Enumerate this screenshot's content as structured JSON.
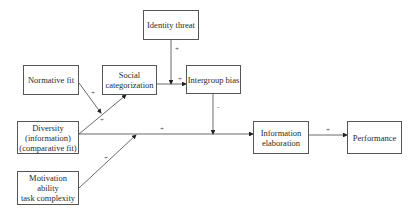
{
  "diagram": {
    "nodes": [
      {
        "id": "identity_threat",
        "label": "Identity threat"
      },
      {
        "id": "normative_fit",
        "label": "Normative fit"
      },
      {
        "id": "social_categorization",
        "label": "Social\ncategorization"
      },
      {
        "id": "intergroup_bias",
        "label": "Intergroup bias"
      },
      {
        "id": "diversity",
        "label": "Diversity\n(information)\n(comparative fit)"
      },
      {
        "id": "information_elaboration",
        "label": "Information\nelaboration"
      },
      {
        "id": "performance",
        "label": "Performance"
      },
      {
        "id": "motivation",
        "label": "Motivation\nability\ntask complexity"
      }
    ],
    "edges": [
      {
        "from": "diversity",
        "to": "social_categorization",
        "sign": "+"
      },
      {
        "from": "normative_fit",
        "to": "diversity->social_categorization",
        "sign": "+"
      },
      {
        "from": "social_categorization",
        "to": "intergroup_bias",
        "sign": "+"
      },
      {
        "from": "identity_threat",
        "to": "social_categorization->intergroup_bias",
        "sign": "+"
      },
      {
        "from": "diversity",
        "to": "information_elaboration",
        "sign": "+"
      },
      {
        "from": "intergroup_bias",
        "to": "diversity->information_elaboration",
        "sign": "-"
      },
      {
        "from": "motivation",
        "to": "diversity->information_elaboration",
        "sign": "+"
      },
      {
        "from": "information_elaboration",
        "to": "performance",
        "sign": "+"
      }
    ]
  }
}
